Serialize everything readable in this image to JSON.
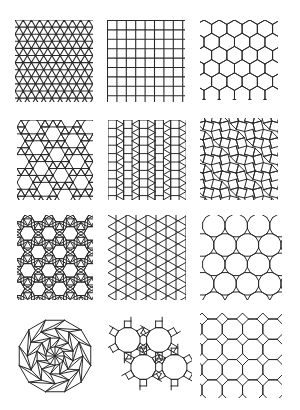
{
  "figure": {
    "background": "#ffffff",
    "stroke_color": "#2a2a2a",
    "grid": {
      "rows": 4,
      "cols": 3
    },
    "tiles": [
      {
        "id": "triangular",
        "name": "triangular-tiling",
        "vertex_config": "3.3.3.3.3.3",
        "x": 15,
        "y": 20,
        "w": 78,
        "h": 82,
        "edge": 8.2,
        "stroke": 1.1
      },
      {
        "id": "square",
        "name": "square-tiling",
        "vertex_config": "4.4.4.4",
        "x": 107,
        "y": 20,
        "w": 78,
        "h": 82,
        "edge": 9.4,
        "stroke": 1.1
      },
      {
        "id": "hexagonal",
        "name": "hexagonal-tiling",
        "vertex_config": "6.6.6",
        "x": 200,
        "y": 20,
        "w": 78,
        "h": 80,
        "edge": 8.8,
        "stroke": 1.0
      },
      {
        "id": "snub-hexagonal",
        "name": "snub-hexagonal-tiling",
        "vertex_config": "3.3.3.3.6",
        "x": 17,
        "y": 120,
        "w": 76,
        "h": 80,
        "edge": 8.0,
        "stroke": 1.0
      },
      {
        "id": "elongated-triangular",
        "name": "elongated-triangular-tiling",
        "vertex_config": "3.3.3.4.4",
        "x": 108,
        "y": 120,
        "w": 78,
        "h": 80,
        "edge": 8.4,
        "stroke": 1.0
      },
      {
        "id": "snub-square",
        "name": "snub-square-tiling",
        "vertex_config": "3.3.4.3.4",
        "x": 200,
        "y": 118,
        "w": 78,
        "h": 82,
        "edge": 8.6,
        "stroke": 1.0
      },
      {
        "id": "rhombitrihexagonal",
        "name": "rhombitrihexagonal-tiling",
        "vertex_config": "3.4.6.4",
        "x": 17,
        "y": 215,
        "w": 76,
        "h": 85,
        "edge": 7.8,
        "stroke": 1.0
      },
      {
        "id": "trihexagonal",
        "name": "trihexagonal-tiling",
        "vertex_config": "3.6.3.6",
        "x": 108,
        "y": 215,
        "w": 78,
        "h": 85,
        "edge": 10.0,
        "stroke": 1.0
      },
      {
        "id": "truncated-hexagonal",
        "name": "truncated-hexagonal-tiling",
        "vertex_config": "3.12.12",
        "x": 200,
        "y": 215,
        "w": 82,
        "h": 85,
        "edge": 6.0,
        "stroke": 1.0
      },
      {
        "id": "radial-dodecagon",
        "name": "radial-dodecagon-dissection",
        "vertex_config": "radial",
        "x": 17,
        "y": 318,
        "w": 76,
        "h": 76,
        "edge": 37,
        "stroke": 1.0,
        "sides": 12,
        "rings": 4
      },
      {
        "id": "truncated-trihexagonal",
        "name": "truncated-trihexagonal-tiling",
        "vertex_config": "4.6.12",
        "x": 108,
        "y": 310,
        "w": 84,
        "h": 92,
        "edge": 6.6,
        "stroke": 1.0
      },
      {
        "id": "truncated-square",
        "name": "truncated-square-tiling",
        "vertex_config": "4.8.8",
        "x": 200,
        "y": 313,
        "w": 82,
        "h": 85,
        "edge": 8.4,
        "stroke": 1.0
      }
    ]
  }
}
